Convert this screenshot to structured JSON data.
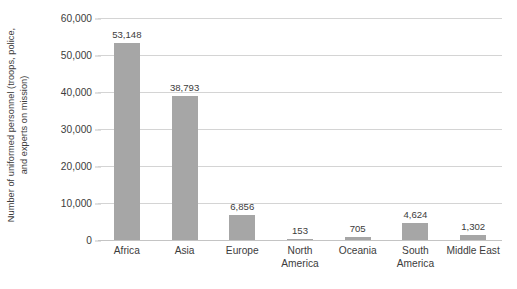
{
  "chart_data": {
    "type": "bar",
    "title": "",
    "xlabel": "",
    "ylabel": "Number of uniformed personnel (troops, police, and experts on mission)",
    "ylabel_lines": [
      "Number of uniformed personnel (troops, police,",
      "and experts on mission)"
    ],
    "categories": [
      "Africa",
      "Asia",
      "Europe",
      "North America",
      "Oceania",
      "South America",
      "Middle East"
    ],
    "category_lines": [
      [
        "Africa"
      ],
      [
        "Asia"
      ],
      [
        "Europe"
      ],
      [
        "North",
        "America"
      ],
      [
        "Oceania"
      ],
      [
        "South",
        "America"
      ],
      [
        "Middle East"
      ]
    ],
    "values": [
      53148,
      38793,
      6856,
      153,
      705,
      4624,
      1302
    ],
    "value_labels": [
      "53,148",
      "38,793",
      "6,856",
      "153",
      "705",
      "4,624",
      "1,302"
    ],
    "ylim": [
      0,
      60000
    ],
    "ytick_values": [
      0,
      10000,
      20000,
      30000,
      40000,
      50000,
      60000
    ],
    "ytick_labels": [
      "0",
      "10,000",
      "20,000",
      "30,000",
      "40,000",
      "50,000",
      "60,000"
    ],
    "grid": true,
    "legend": "none",
    "bar_color": "#a6a6a6",
    "gridline_color": "#d4d4d4",
    "text_color": "#3c3c3c",
    "background_color": "#ffffff"
  }
}
